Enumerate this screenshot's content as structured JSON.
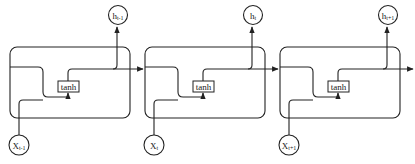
{
  "diagram": {
    "type": "rnn-unrolled",
    "stroke_color": "#222222",
    "background": "#ffffff",
    "cells": [
      {
        "offset_x": 0,
        "activation": "tanh",
        "input": {
          "base": "X",
          "sub": "t-1"
        },
        "output": {
          "base": "h",
          "sub": "t-1"
        }
      },
      {
        "offset_x": 135,
        "activation": "tanh",
        "input": {
          "base": "X",
          "sub": "t"
        },
        "output": {
          "base": "h",
          "sub": "t"
        }
      },
      {
        "offset_x": 270,
        "activation": "tanh",
        "input": {
          "base": "X",
          "sub": "t+1"
        },
        "output": {
          "base": "h",
          "sub": "t+1"
        }
      }
    ]
  }
}
